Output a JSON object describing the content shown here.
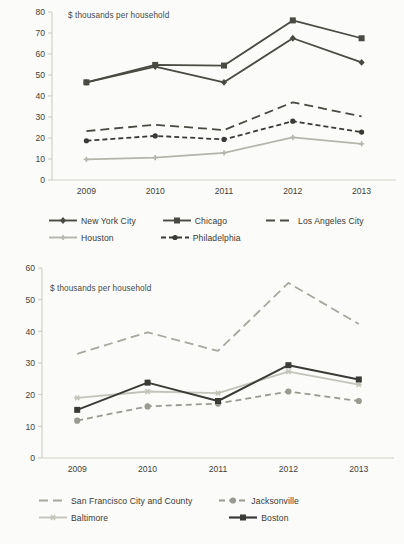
{
  "page": {
    "background": "#fbfbf9",
    "text_color": "#3a3a36"
  },
  "charts": [
    {
      "id": "chart-top",
      "annotation": "$ thousands per household",
      "x_label_2009": "2009",
      "x_label_2010": "2010",
      "x_label_2011": "2011",
      "x_label_2012": "2012",
      "x_label_2013": "2013",
      "legend": [
        {
          "label": "New York City",
          "color": "#4a4a44",
          "style": "solid",
          "marker": "diamond"
        },
        {
          "label": "Chicago",
          "color": "#4a4a44",
          "style": "solid",
          "marker": "square"
        },
        {
          "label": "Los Angeles City",
          "color": "#4a4a44",
          "style": "longdash",
          "marker": "none"
        },
        {
          "label": "Houston",
          "color": "#b5b5ad",
          "style": "solid",
          "marker": "tick"
        },
        {
          "label": "Philadelphia",
          "color": "#3a3a36",
          "style": "dashdot",
          "marker": "dot"
        }
      ]
    },
    {
      "id": "chart-bottom",
      "annotation": "$ thousands per household",
      "x_label_2009": "2009",
      "x_label_2010": "2010",
      "x_label_2011": "2011",
      "x_label_2012": "2012",
      "x_label_2013": "2013",
      "legend": [
        {
          "label": "San Francisco City and County",
          "color": "#a8a8a0",
          "style": "longdash",
          "marker": "none"
        },
        {
          "label": "Jacksonville",
          "color": "#9a9a92",
          "style": "dash",
          "marker": "circle"
        },
        {
          "label": "Baltimore",
          "color": "#c3c3bb",
          "style": "solid",
          "marker": "star"
        },
        {
          "label": "Boston",
          "color": "#3a3a36",
          "style": "solid",
          "marker": "square"
        }
      ]
    }
  ],
  "chart_data": [
    {
      "type": "line",
      "title": "",
      "subtitle": "",
      "annotation": "$ thousands per household",
      "xlabel": "",
      "ylabel": "",
      "categories": [
        "2009",
        "2010",
        "2011",
        "2012",
        "2013"
      ],
      "ylim": [
        0,
        80
      ],
      "ytick_step": 10,
      "yticks": [
        0,
        10,
        20,
        30,
        40,
        50,
        60,
        70,
        80
      ],
      "grid": false,
      "legend_position": "bottom",
      "series": [
        {
          "name": "New York City",
          "values": [
            46.5,
            54.0,
            46.5,
            67.5,
            56.0
          ]
        },
        {
          "name": "Chicago",
          "values": [
            46.5,
            54.8,
            54.5,
            76.0,
            67.5
          ]
        },
        {
          "name": "Los Angeles City",
          "values": [
            23.3,
            26.3,
            23.8,
            37.0,
            30.3
          ]
        },
        {
          "name": "Houston",
          "values": [
            9.8,
            10.7,
            12.9,
            20.3,
            17.2
          ]
        },
        {
          "name": "Philadelphia",
          "values": [
            18.7,
            21.0,
            19.3,
            28.0,
            22.8
          ]
        }
      ]
    },
    {
      "type": "line",
      "title": "",
      "subtitle": "",
      "annotation": "$ thousands per household",
      "xlabel": "",
      "ylabel": "",
      "categories": [
        "2009",
        "2010",
        "2011",
        "2012",
        "2013"
      ],
      "ylim": [
        0,
        60
      ],
      "ytick_step": 10,
      "yticks": [
        0,
        10,
        20,
        30,
        40,
        50,
        60
      ],
      "grid": false,
      "legend_position": "bottom",
      "series": [
        {
          "name": "San Francisco City and County",
          "values": [
            32.9,
            39.7,
            33.8,
            55.3,
            42.3
          ]
        },
        {
          "name": "Jacksonville",
          "values": [
            11.8,
            16.3,
            17.2,
            21.0,
            18.0
          ]
        },
        {
          "name": "Baltimore",
          "values": [
            19.0,
            21.0,
            20.5,
            27.3,
            23.2
          ]
        },
        {
          "name": "Boston",
          "values": [
            15.2,
            23.8,
            18.0,
            29.3,
            24.8
          ]
        }
      ]
    }
  ]
}
